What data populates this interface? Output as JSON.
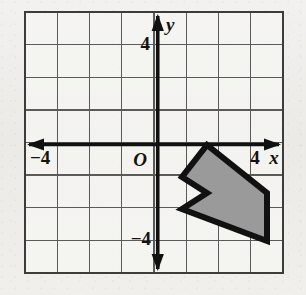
{
  "figure": {
    "kind": "coordinate-grid-diagram",
    "background_color": "#efeeec",
    "grid_color": "#5a5a58",
    "axis_color": "#111111",
    "shape_fill": "#9a9a9a",
    "shape_stroke": "#111111"
  },
  "grid": {
    "left_px": 25,
    "top_px": 12,
    "right_px": 283,
    "bottom_px": 273,
    "cell_px": 32.25,
    "columns": 8,
    "rows": 8,
    "x_min": -4,
    "x_max": 4,
    "y_min": -4,
    "y_max": 4
  },
  "axes": {
    "origin_px": {
      "x": 157.75,
      "y": 144.5
    },
    "x_axis": {
      "label": "x",
      "left_arrow": true,
      "right_arrow": true,
      "ticks": [
        {
          "label": "−4",
          "value": -4
        },
        {
          "label": "4",
          "value": 4
        }
      ]
    },
    "y_axis": {
      "label": "y",
      "up_arrow": true,
      "down_arrow": true,
      "ticks": [
        {
          "label": "4",
          "value": 4
        },
        {
          "label": "−4",
          "value": -4
        }
      ]
    },
    "origin_label": "O"
  },
  "chart_data": {
    "type": "scatter",
    "title": "",
    "xlabel": "x",
    "ylabel": "y",
    "xlim": [
      -4,
      4
    ],
    "ylim": [
      -4,
      4
    ],
    "grid": true,
    "legend": "none",
    "shapes": [
      {
        "name": "shaded-chevron-polygon",
        "fill": "#9a9a9a",
        "stroke": "#111111",
        "closed": true,
        "vertices": [
          {
            "x": 1.5,
            "y": 0.0
          },
          {
            "x": 3.4,
            "y": -1.5
          },
          {
            "x": 3.4,
            "y": -3.0
          },
          {
            "x": 0.75,
            "y": -1.5
          },
          {
            "x": 0.75,
            "y": -2.0
          },
          {
            "x": -0.2,
            "y": -2.0
          },
          {
            "x": -0.2,
            "y": -1.0
          },
          {
            "x": 1.5,
            "y": -1.5
          }
        ],
        "vertices_px": [
          {
            "x": 207,
            "y": 145
          },
          {
            "x": 267,
            "y": 193
          },
          {
            "x": 267,
            "y": 241
          },
          {
            "x": 182,
            "y": 209
          },
          {
            "x": 207,
            "y": 193
          },
          {
            "x": 182,
            "y": 177
          }
        ]
      }
    ]
  }
}
